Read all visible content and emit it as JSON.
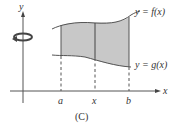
{
  "figure": {
    "caption": "(C)",
    "y_axis_label": "y",
    "x_axis_label": "x",
    "upper_curve_label": "y = f(x)",
    "lower_curve_label": "y = g(x)",
    "tick_labels": [
      "a",
      "x",
      "b"
    ],
    "rotation_icon": "rotation-arrow-icon",
    "colors": {
      "region_fill": "#c8c8c8",
      "lines": "#555555",
      "text": "#333333"
    }
  }
}
